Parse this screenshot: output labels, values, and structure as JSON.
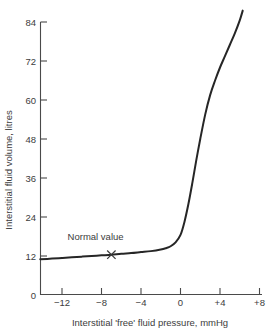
{
  "chart_data": {
    "type": "line",
    "title": "",
    "xlabel": "Interstitial 'free' fluid pressure, mmHg",
    "ylabel": "Interstitial fluid volume, litres",
    "xlim": [
      -14.2,
      8
    ],
    "ylim": [
      0,
      90
    ],
    "xticks": [
      -12,
      -8,
      -4,
      0,
      4,
      8
    ],
    "xticklabels": [
      "−12",
      "−8",
      "−4",
      "0",
      "+4",
      "+8"
    ],
    "yticks": [
      0,
      12,
      24,
      36,
      48,
      60,
      72,
      84
    ],
    "yticklabels": [
      "0",
      "12",
      "24",
      "36",
      "48",
      "60",
      "72",
      "84"
    ],
    "grid": false,
    "legend": null,
    "series": [
      {
        "name": "Interstitial fluid volume vs pressure",
        "x": [
          -14.2,
          -13.0,
          -12.0,
          -11.0,
          -10.0,
          -9.0,
          -8.0,
          -7.0,
          -6.0,
          -5.0,
          -4.0,
          -3.0,
          -2.0,
          -1.5,
          -1.0,
          -0.5,
          0.0,
          0.4,
          0.8,
          1.2,
          1.6,
          2.0,
          2.5,
          3.0,
          3.5,
          4.0,
          4.5,
          5.0,
          5.5,
          6.0,
          6.3
        ],
        "y": [
          11.0,
          11.2,
          11.4,
          11.6,
          11.8,
          12.0,
          12.2,
          12.4,
          12.7,
          12.9,
          13.2,
          13.5,
          14.0,
          14.4,
          15.0,
          16.2,
          18.5,
          22.5,
          28.0,
          34.5,
          41.5,
          48.0,
          55.5,
          61.5,
          66.0,
          70.0,
          73.5,
          77.0,
          80.5,
          84.5,
          87.5
        ]
      }
    ],
    "annotations": [
      {
        "text": "Normal value",
        "marker": "x",
        "x": -7.0,
        "y": 12.4,
        "label_x": -8.6,
        "label_y": 17.0
      }
    ]
  },
  "axes": {
    "y_title": "Interstitial fluid volume, litres",
    "x_title": "Interstitial 'free' fluid pressure, mmHg"
  },
  "colors": {
    "curve": "#262626",
    "axis": "#4a4a4a",
    "text": "#3c3c3c",
    "background": "#ffffff"
  }
}
